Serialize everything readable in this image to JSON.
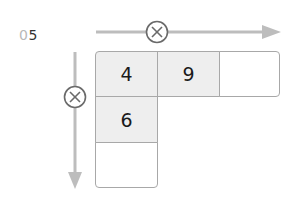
{
  "problem_number": {
    "prefix": "0",
    "digit": "5"
  },
  "operator_symbol": "multiply-circle",
  "colors": {
    "arrow": "#bdbdbd",
    "circle": "#6a6a6a",
    "cell_fill": "#eeeeee",
    "cell_border": "#a8a8a8"
  },
  "grid": {
    "row1": [
      "4",
      "9",
      ""
    ],
    "col1": [
      "4",
      "6",
      ""
    ]
  },
  "cells": {
    "r1c1": "4",
    "r1c2": "9",
    "r1c3": "",
    "r2c1": "6",
    "r3c1": ""
  }
}
